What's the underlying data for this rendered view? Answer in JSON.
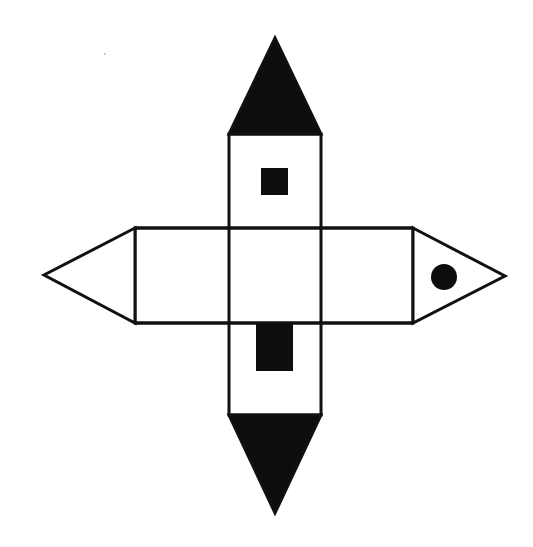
{
  "diagram": {
    "type": "net-of-3d-shape",
    "colors": {
      "stroke": "#111111",
      "fill_dark": "#0d0d0d",
      "fill_light": "#ffffff",
      "background": "#ffffff"
    },
    "stroke_width": 3,
    "faces": {
      "vertical_strip": {
        "x": 229,
        "y": 134,
        "w": 92,
        "h": 281
      },
      "horizontal_strip": {
        "x": 135,
        "y": 228,
        "w": 278,
        "h": 95
      },
      "top_triangle": {
        "points": "229,134 275,38 321,134",
        "fill": "dark"
      },
      "bottom_triangle": {
        "points": "229,415 275,513 321,415",
        "fill": "dark"
      },
      "left_triangle": {
        "points": "135,228 44,275 135,323",
        "fill": "light"
      },
      "right_triangle": {
        "points": "413,228 505,276 413,323",
        "fill": "light"
      }
    },
    "markers": {
      "small_square": {
        "x": 261,
        "y": 168,
        "w": 27,
        "h": 27,
        "shape": "square"
      },
      "rectangle": {
        "x": 256,
        "y": 323,
        "w": 37,
        "h": 48,
        "shape": "rectangle"
      },
      "circle": {
        "cx": 444,
        "cy": 277,
        "r": 13,
        "shape": "circle"
      }
    }
  }
}
